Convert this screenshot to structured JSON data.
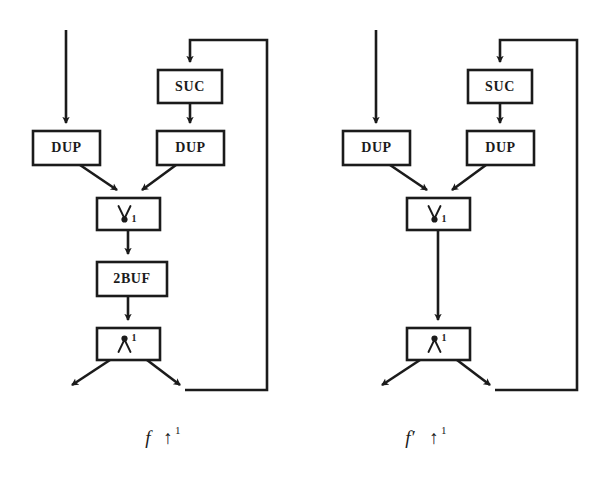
{
  "figure": {
    "background_color": "#ffffff",
    "line_color": "#1b1b1b"
  },
  "diagrams": [
    {
      "id": "left",
      "caption": {
        "name": "f",
        "operator": "↑",
        "exponent": "1"
      },
      "nodes": [
        {
          "id": "suc",
          "label": "SUC"
        },
        {
          "id": "dup_l",
          "label": "DUP"
        },
        {
          "id": "dup_r",
          "label": "DUP"
        },
        {
          "id": "merge",
          "label": "∨",
          "index": "1",
          "kind": "merge-glyph"
        },
        {
          "id": "buf",
          "label": "2BUF"
        },
        {
          "id": "split",
          "label": "∧",
          "index": "1",
          "kind": "split-glyph"
        }
      ],
      "edges": [
        {
          "from": "external-input",
          "to": "dup_l"
        },
        {
          "from": "feedback-loop",
          "to": "suc"
        },
        {
          "from": "suc",
          "to": "dup_r"
        },
        {
          "from": "dup_l",
          "to": "merge"
        },
        {
          "from": "dup_r",
          "to": "merge"
        },
        {
          "from": "merge",
          "to": "buf"
        },
        {
          "from": "buf",
          "to": "split"
        },
        {
          "from": "split",
          "to": "external-output"
        },
        {
          "from": "split",
          "to": "feedback-loop"
        }
      ]
    },
    {
      "id": "right",
      "caption": {
        "name": "f′",
        "operator": "↑",
        "exponent": "1"
      },
      "nodes": [
        {
          "id": "suc",
          "label": "SUC"
        },
        {
          "id": "dup_l",
          "label": "DUP"
        },
        {
          "id": "dup_r",
          "label": "DUP"
        },
        {
          "id": "merge",
          "label": "∨",
          "index": "1",
          "kind": "merge-glyph"
        },
        {
          "id": "split",
          "label": "∧",
          "index": "1",
          "kind": "split-glyph"
        }
      ],
      "edges": [
        {
          "from": "external-input",
          "to": "dup_l"
        },
        {
          "from": "feedback-loop",
          "to": "suc"
        },
        {
          "from": "suc",
          "to": "dup_r"
        },
        {
          "from": "dup_l",
          "to": "merge"
        },
        {
          "from": "dup_r",
          "to": "merge"
        },
        {
          "from": "merge",
          "to": "split"
        },
        {
          "from": "split",
          "to": "external-output"
        },
        {
          "from": "split",
          "to": "feedback-loop"
        }
      ]
    }
  ],
  "labels": {
    "suc": "SUC",
    "dup": "DUP",
    "buf": "2BUF",
    "merge_index": "1",
    "split_index": "1",
    "caption_left_name": "f",
    "caption_left_arrow": "↑",
    "caption_left_exp": "1",
    "caption_right_name": "f′",
    "caption_right_arrow": "↑",
    "caption_right_exp": "1"
  }
}
